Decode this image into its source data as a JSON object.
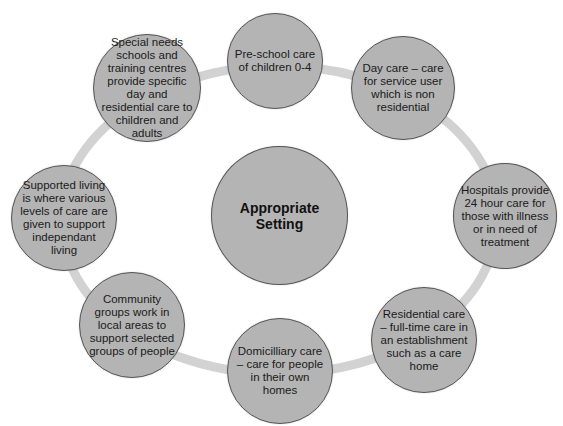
{
  "diagram": {
    "center": {
      "label": "Appropriate Setting"
    },
    "colors": {
      "circle_fill": "#b4b4b4",
      "circle_border": "#555555",
      "ring": "#d2d2d2",
      "text": "#1a1a1a"
    },
    "nodes": [
      {
        "id": "pre-school",
        "label": "Pre-school care of children 0-4"
      },
      {
        "id": "day-care",
        "label": "Day care – care for service user which is non residential"
      },
      {
        "id": "hospitals",
        "label": "Hospitals provide 24 hour care for those with illness or in need of treatment"
      },
      {
        "id": "residential",
        "label": "Residential care – full-time care in an establishment such as a care home"
      },
      {
        "id": "domiciliary",
        "label": "Domicilliary care – care for people in their own homes"
      },
      {
        "id": "community",
        "label": "Community groups work in local areas to support selected groups of people"
      },
      {
        "id": "supported-living",
        "label": "Supported living is where various levels of care are given to support independant living"
      },
      {
        "id": "special-needs",
        "label": "Special needs schools and training centres provide specific day and residential care to children and adults"
      }
    ]
  }
}
